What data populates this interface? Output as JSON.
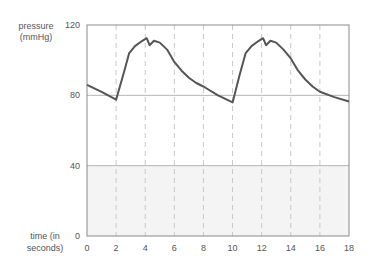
{
  "chart_data": {
    "type": "line",
    "title": "",
    "ylabel": "pressure (mmHg)",
    "ylabel_lines": [
      "pressure",
      "(mmHg)"
    ],
    "xlabel": "time (in seconds)",
    "xlabel_lines": [
      "time (in",
      "seconds)"
    ],
    "xlim": [
      0,
      18
    ],
    "ylim": [
      0,
      120
    ],
    "x_ticks": [
      "0",
      "2",
      "4",
      "6",
      "8",
      "10",
      "12",
      "14",
      "16",
      "18"
    ],
    "y_ticks": [
      "0",
      "40",
      "80",
      "120"
    ],
    "grid": {
      "horizontal": [
        40,
        80
      ],
      "vertical_dashed": [
        2,
        4,
        6,
        8,
        10,
        12,
        14,
        16
      ]
    },
    "shaded_region": {
      "y_from": 0,
      "y_to": 40,
      "color": "#f4f4f4"
    },
    "line_color": "#555555",
    "series": [
      {
        "name": "pressure",
        "points": [
          [
            0,
            86
          ],
          [
            1,
            82
          ],
          [
            2,
            77.5
          ],
          [
            2.5,
            92
          ],
          [
            2.9,
            104
          ],
          [
            3.3,
            108
          ],
          [
            3.8,
            111
          ],
          [
            4.1,
            112.5
          ],
          [
            4.3,
            108.5
          ],
          [
            4.6,
            111
          ],
          [
            5.0,
            110
          ],
          [
            5.5,
            106
          ],
          [
            6.0,
            99
          ],
          [
            6.5,
            94
          ],
          [
            7.0,
            90
          ],
          [
            7.5,
            87
          ],
          [
            8.0,
            85
          ],
          [
            9.0,
            80
          ],
          [
            10.0,
            76
          ],
          [
            10.5,
            92
          ],
          [
            10.9,
            104
          ],
          [
            11.3,
            108
          ],
          [
            11.8,
            111
          ],
          [
            12.1,
            112.5
          ],
          [
            12.3,
            108.5
          ],
          [
            12.6,
            111
          ],
          [
            13.0,
            110
          ],
          [
            13.5,
            106
          ],
          [
            14.0,
            101
          ],
          [
            14.5,
            94
          ],
          [
            15.0,
            89
          ],
          [
            15.5,
            85
          ],
          [
            16.0,
            82
          ],
          [
            17.0,
            79
          ],
          [
            18.0,
            76.5
          ]
        ]
      }
    ]
  }
}
